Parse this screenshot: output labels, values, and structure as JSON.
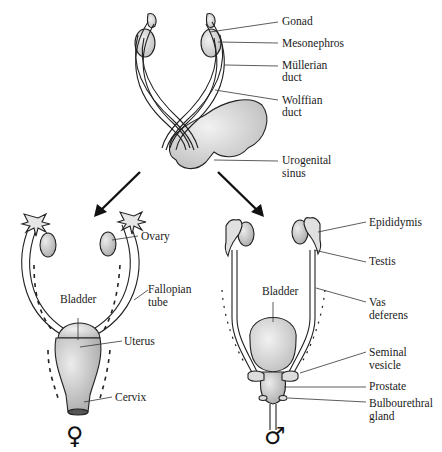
{
  "diagram": {
    "top": {
      "labels": {
        "gonad": "Gonad",
        "mesonephros": "Mesonephros",
        "mullerian_1": "Müllerian",
        "mullerian_2": "duct",
        "wolffian_1": "Wolffian",
        "wolffian_2": "duct",
        "urogenital_1": "Urogenital",
        "urogenital_2": "sinus"
      }
    },
    "female": {
      "symbol": "♀",
      "labels": {
        "ovary": "Ovary",
        "fallopian_1": "Fallopian",
        "fallopian_2": "tube",
        "bladder": "Bladder",
        "uterus": "Uterus",
        "cervix": "Cervix"
      }
    },
    "male": {
      "symbol": "♂",
      "labels": {
        "epididymis": "Epididymis",
        "testis": "Testis",
        "vas_1": "Vas",
        "vas_2": "deferens",
        "bladder": "Bladder",
        "seminal_1": "Seminal",
        "seminal_2": "vesicle",
        "prostate": "Prostate",
        "bulbo_1": "Bulbourethral",
        "bulbo_2": "gland"
      }
    }
  }
}
